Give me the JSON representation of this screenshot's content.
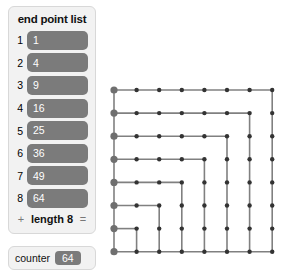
{
  "list_panel": {
    "title": "end point list",
    "items": [
      {
        "index": "1",
        "value": "1"
      },
      {
        "index": "2",
        "value": "4"
      },
      {
        "index": "3",
        "value": "9"
      },
      {
        "index": "4",
        "value": "16"
      },
      {
        "index": "5",
        "value": "25"
      },
      {
        "index": "6",
        "value": "36"
      },
      {
        "index": "7",
        "value": "49"
      },
      {
        "index": "8",
        "value": "64"
      }
    ],
    "footer": {
      "add_label": "+",
      "length_label": "length 8",
      "equals_label": "="
    }
  },
  "counter": {
    "label": "counter",
    "value": "64"
  },
  "colors": {
    "pill": "#7b7b7b",
    "panel_bg": "#f2f2f2",
    "panel_border": "#d8d8d8",
    "grid_line": "#808080",
    "node_dot": "#333333",
    "endpoint_dot": "#6f6f6f",
    "text": "#111111"
  },
  "chart_data": {
    "type": "scatter",
    "title": "",
    "xlabel": "",
    "ylabel": "",
    "grid": true,
    "legend": null,
    "rows": 8,
    "cols": 8,
    "x": [
      0,
      1,
      2,
      3,
      4,
      5,
      6,
      7
    ],
    "y": [
      0,
      1,
      2,
      3,
      4,
      5,
      6,
      7
    ],
    "endpoint_column": 0,
    "endpoint_values": [
      1,
      4,
      9,
      16,
      25,
      36,
      49,
      64
    ],
    "horizontal_runs": [
      {
        "row": 0,
        "from_col": 0,
        "to_col": 7
      },
      {
        "row": 1,
        "from_col": 0,
        "to_col": 6
      },
      {
        "row": 2,
        "from_col": 0,
        "to_col": 5
      },
      {
        "row": 3,
        "from_col": 0,
        "to_col": 4
      },
      {
        "row": 4,
        "from_col": 0,
        "to_col": 3
      },
      {
        "row": 5,
        "from_col": 0,
        "to_col": 2
      },
      {
        "row": 6,
        "from_col": 0,
        "to_col": 1
      },
      {
        "row": 7,
        "from_col": 0,
        "to_col": 7
      }
    ],
    "vertical_runs": [
      {
        "col": 7,
        "from_row": 0,
        "to_row": 7
      },
      {
        "col": 6,
        "from_row": 1,
        "to_row": 7
      },
      {
        "col": 5,
        "from_row": 2,
        "to_row": 7
      },
      {
        "col": 4,
        "from_row": 3,
        "to_row": 7
      },
      {
        "col": 3,
        "from_row": 4,
        "to_row": 7
      },
      {
        "col": 2,
        "from_row": 5,
        "to_row": 7
      },
      {
        "col": 1,
        "from_row": 6,
        "to_row": 7
      },
      {
        "col": 0,
        "from_row": 0,
        "to_row": 7
      }
    ]
  }
}
